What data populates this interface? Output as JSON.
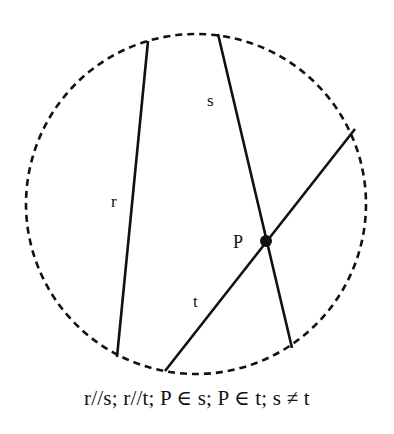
{
  "figure": {
    "background_color": "#ffffff",
    "stroke_color": "#111111",
    "caption": "r//s; r//t; P ∈ s; P ∈ t; s ≠ t"
  },
  "circle": {
    "name": "dashed-boundary-circle",
    "center_x": 196,
    "center_y": 204,
    "radius": 170,
    "stroke_style": "dashed",
    "dash_pattern": "7 5",
    "stroke_width": 2.6,
    "stroke_color": "#111111",
    "fill": "none"
  },
  "lines": [
    {
      "id": "r",
      "label": "r",
      "x1": 148,
      "y1": 41,
      "x2": 117,
      "y2": 357,
      "stroke_width": 2.6,
      "stroke_color": "#111111",
      "label_x": 111,
      "label_y": 207
    },
    {
      "id": "s",
      "label": "s",
      "x1": 218,
      "y1": 34,
      "x2": 292,
      "y2": 348,
      "stroke_width": 2.6,
      "stroke_color": "#111111",
      "label_x": 207,
      "label_y": 106
    },
    {
      "id": "t",
      "label": "t",
      "x1": 165,
      "y1": 371,
      "x2": 355,
      "y2": 129,
      "stroke_width": 2.6,
      "stroke_color": "#111111",
      "label_x": 193,
      "label_y": 307
    }
  ],
  "points": [
    {
      "id": "P",
      "label": "P",
      "x": 266,
      "y": 241,
      "radius": 6,
      "fill": "#111111",
      "label_x": 233,
      "label_y": 248
    }
  ]
}
